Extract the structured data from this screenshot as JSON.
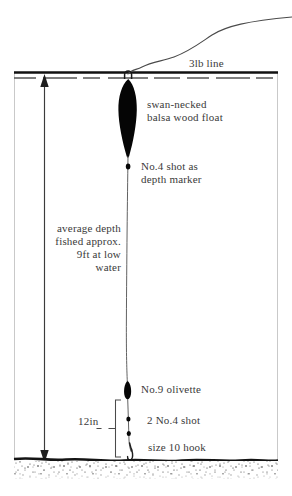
{
  "diagram": {
    "type": "technical-illustration",
    "colors": {
      "ink": "#1a1a1a",
      "text": "#3a3a3a",
      "frame": "#c8c8c8",
      "background": "#ffffff",
      "waterline": "#111111",
      "riverbed": "#2a2a2a"
    },
    "labels": {
      "line": "3lb line",
      "float_l1": "swan-necked",
      "float_l2": "balsa wood float",
      "depth_marker_l1": "No.4 shot as",
      "depth_marker_l2": "depth marker",
      "average_depth_l1": "average depth",
      "average_depth_l2": "fished approx.",
      "average_depth_l3": "9ft at low",
      "average_depth_l4": "water",
      "olivette": "No.9 olivette",
      "shot": "2 No.4 shot",
      "hook": "size 10 hook",
      "bracket_measure": "12in"
    },
    "measurements": {
      "depth_value": "9ft",
      "depth_condition": "at low water",
      "tail_length": "12in",
      "line_strength": "3lb",
      "shot_size": "No.4",
      "shot_count": "2",
      "olivette_size": "No.9",
      "hook_size": "size 10"
    },
    "components": [
      "3lb line",
      "swan-necked balsa wood float",
      "No.4 shot as depth marker",
      "No.9 olivette",
      "2 No.4 shot",
      "size 10 hook"
    ]
  }
}
